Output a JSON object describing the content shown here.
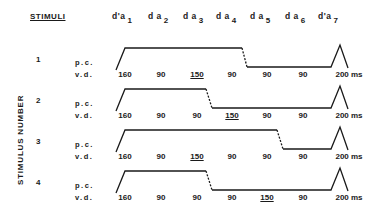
{
  "header": {
    "title": "STIMULI",
    "segments": [
      {
        "label": "d'a",
        "index": "1"
      },
      {
        "label": "d a",
        "index": "2"
      },
      {
        "label": "d a",
        "index": "3"
      },
      {
        "label": "d a",
        "index": "4"
      },
      {
        "label": "d a",
        "index": "5"
      },
      {
        "label": "d a",
        "index": "6"
      },
      {
        "label": "d'a",
        "index": "7"
      }
    ]
  },
  "axis_label": "STIMULUS NUMBER",
  "row_labels": {
    "pitch_contour": "p.c.",
    "vowel_duration": "v.d."
  },
  "unit": "ms",
  "stimuli": [
    {
      "number": "1",
      "durations": [
        "160",
        "90",
        "150",
        "90",
        "90",
        "90",
        "200"
      ],
      "stressed_index": 2,
      "drop_after_slot": 4
    },
    {
      "number": "2",
      "durations": [
        "160",
        "90",
        "150",
        "90",
        "90",
        "90",
        "200"
      ],
      "stressed_index": 3,
      "drop_after_slot": 3
    },
    {
      "number": "3",
      "durations": [
        "160",
        "90",
        "150",
        "90",
        "90",
        "90",
        "200"
      ],
      "stressed_index": 2,
      "drop_after_slot": 5
    },
    {
      "number": "4",
      "durations": [
        "160",
        "90",
        "90",
        "90",
        "150",
        "90",
        "200"
      ],
      "stressed_index": 4,
      "drop_after_slot": 3
    }
  ],
  "display": {
    "row1_values": [
      "160",
      "90",
      "150",
      "90",
      "90",
      "90",
      "200 ms"
    ],
    "row2_values": [
      "160",
      "90",
      "90",
      "150",
      "90",
      "90",
      "200 ms"
    ],
    "row3_values": [
      "160",
      "90",
      "150",
      "90",
      "90",
      "90",
      "200 ms"
    ],
    "row4_values": [
      "160",
      "90",
      "90",
      "90",
      "150",
      "90",
      "200 ms"
    ]
  },
  "colors": {
    "ink": "#1a1a1a",
    "background": "#ffffff"
  }
}
